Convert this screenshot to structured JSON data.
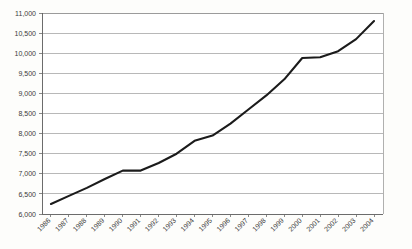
{
  "chart_data": {
    "type": "line",
    "title": "",
    "xlabel": "",
    "ylabel": "",
    "categories": [
      "1986",
      "1987",
      "1988",
      "1989",
      "1990",
      "1991",
      "1992",
      "1993",
      "1994",
      "1995",
      "1996",
      "1997",
      "1998",
      "1999",
      "2000",
      "2001",
      "2002",
      "2003",
      "2004"
    ],
    "values": [
      6250,
      6450,
      6650,
      6870,
      7080,
      7080,
      7270,
      7500,
      7820,
      7950,
      8250,
      8600,
      8950,
      9350,
      9880,
      9900,
      10050,
      10350,
      10800
    ],
    "series": [
      {
        "name": "",
        "values": [
          6250,
          6450,
          6650,
          6870,
          7080,
          7080,
          7270,
          7500,
          7820,
          7950,
          8250,
          8600,
          8950,
          9350,
          9880,
          9900,
          10050,
          10350,
          10800
        ]
      }
    ],
    "ylim": [
      6000,
      11000
    ],
    "ytick_values": [
      6000,
      6500,
      7000,
      7500,
      8000,
      8500,
      9000,
      9500,
      10000,
      10500,
      11000
    ],
    "ytick_labels": [
      "6,000",
      "6,500",
      "7,000",
      "7,500",
      "8,000",
      "8,500",
      "9,000",
      "9,500",
      "10,000",
      "10,500",
      "11,000"
    ],
    "grid": true,
    "grid_axis": "y",
    "legend": false,
    "legend_position": "none",
    "line_color": "#1b1b1b",
    "grid_color": "#9a9a9a",
    "plot_background": "#ffffff",
    "figure_background": "#fdfdfb",
    "xtick_label_rotation": -45
  }
}
